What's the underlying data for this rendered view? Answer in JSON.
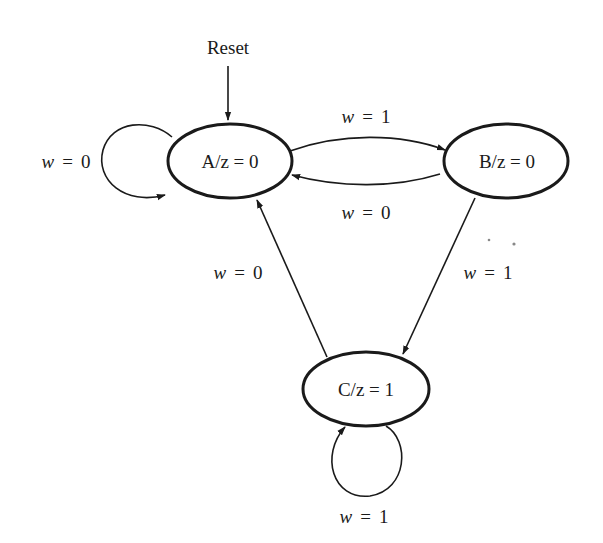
{
  "diagram": {
    "type": "Moore finite state machine",
    "reset_label": "Reset",
    "states": [
      {
        "id": "A",
        "label": "A/z = 0"
      },
      {
        "id": "B",
        "label": "B/z = 0"
      },
      {
        "id": "C",
        "label": "C/z = 1"
      }
    ],
    "transitions": [
      {
        "from": "A",
        "to": "A",
        "var": "w",
        "eq": "=",
        "val": "0"
      },
      {
        "from": "A",
        "to": "B",
        "var": "w",
        "eq": "=",
        "val": "1"
      },
      {
        "from": "B",
        "to": "A",
        "var": "w",
        "eq": "=",
        "val": "0"
      },
      {
        "from": "B",
        "to": "C",
        "var": "w",
        "eq": "=",
        "val": "1"
      },
      {
        "from": "C",
        "to": "A",
        "var": "w",
        "eq": "=",
        "val": "0"
      },
      {
        "from": "C",
        "to": "C",
        "var": "w",
        "eq": "=",
        "val": "1"
      }
    ],
    "colors": {
      "stroke": "#1a1a1a",
      "background": "#ffffff"
    }
  }
}
